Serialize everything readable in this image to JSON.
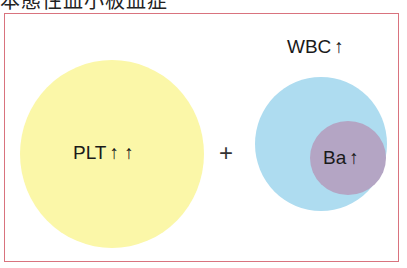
{
  "title": "本態性血小板血症",
  "colors": {
    "frame_border": "#d9737e",
    "plt_circle": "#fbf7a8",
    "wbc_circle": "#aedcf0",
    "ba_circle": "#b4a5c4"
  },
  "diagram": {
    "plt": {
      "label": "PLT",
      "arrows": "↑ ↑"
    },
    "operator": "+",
    "wbc": {
      "label": "WBC",
      "arrows": "↑"
    },
    "ba": {
      "label": "Ba",
      "arrows": "↑"
    }
  }
}
